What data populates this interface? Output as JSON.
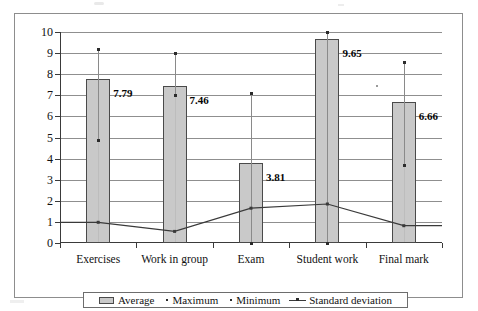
{
  "chart_data": {
    "type": "bar",
    "title": "",
    "xlabel": "",
    "ylabel": "",
    "ylim": [
      0,
      10
    ],
    "ytick_labels": [
      "10",
      "9",
      "8",
      "7",
      "6",
      "5",
      "4",
      "3",
      "2",
      "1",
      "0"
    ],
    "yticks": [
      10,
      9,
      8,
      7,
      6,
      5,
      4,
      3,
      2,
      1,
      0
    ],
    "grid": true,
    "legend_position": "bottom",
    "categories": [
      "Exercises",
      "Work in group",
      "Exam",
      "Student work",
      "Final mark"
    ],
    "series": [
      {
        "name": "Average",
        "type": "bar",
        "values": [
          7.79,
          7.46,
          3.81,
          9.65,
          6.66
        ],
        "data_labels": [
          "7.79",
          "7.46",
          "3.81",
          "9.65",
          "6.66"
        ],
        "color": "#c9c9c9"
      },
      {
        "name": "Maximum",
        "type": "point",
        "values": [
          9.2,
          9.0,
          7.1,
          10.0,
          8.6
        ],
        "color": "#2b2b2b"
      },
      {
        "name": "Minimum",
        "type": "point",
        "values": [
          4.9,
          7.0,
          0.0,
          0.0,
          3.7
        ],
        "color": "#2b2b2b"
      },
      {
        "name": "Standard deviation",
        "type": "line",
        "values": [
          0.98,
          0.55,
          1.65,
          1.85,
          0.82
        ],
        "color": "#3a3a3a"
      }
    ]
  },
  "legend": {
    "average_label": "Average",
    "maximum_label": "Maximum",
    "minimum_label": "Minimum",
    "stddev_label": "Standard deviation"
  }
}
